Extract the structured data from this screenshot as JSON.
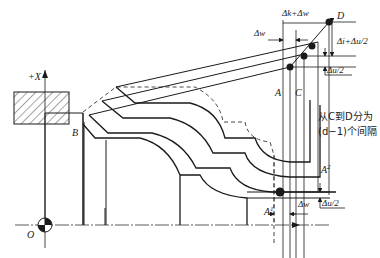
{
  "diagram": {
    "type": "cnc-turning-roughing-cycle",
    "axis": {
      "x_label": "+X",
      "origin_label": "O"
    },
    "points": {
      "A": "A",
      "B": "B",
      "C": "C",
      "D": "D",
      "A1": "A",
      "A1_sup": "1",
      "A2": "A",
      "A2_sup": "2"
    },
    "dimensions": {
      "top_span": "Δk+Δw",
      "top_left": "Δw",
      "right_upper": "Δi+Δu/2",
      "right_lower": "Δu/2",
      "bottom_dw": "Δw",
      "bottom_du": "Δu/2"
    },
    "annotation": {
      "line1": "从C到D分为",
      "line2": "(d−1)个间隔"
    },
    "colors": {
      "stroke": "#1a1a1a",
      "background": "#ffffff"
    }
  }
}
